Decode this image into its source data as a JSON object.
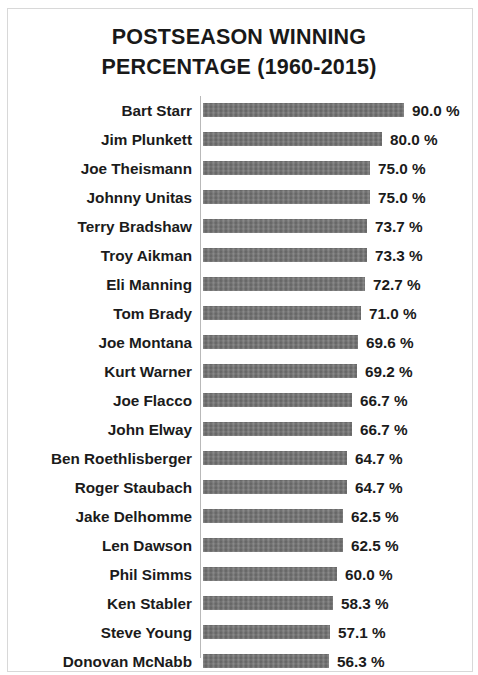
{
  "chart_data": {
    "type": "bar",
    "orientation": "horizontal",
    "title": "POSTSEASON WINNING PERCENTAGE (1960-2015)",
    "title_lines": [
      "POSTSEASON WINNING",
      "PERCENTAGE (1960-2015)"
    ],
    "xlabel": "",
    "ylabel": "",
    "xlim": [
      0,
      90
    ],
    "grid": false,
    "legend": null,
    "value_suffix": " %",
    "bar_color": "#707070",
    "axis_color": "#b9b9b9",
    "categories": [
      "Bart Starr",
      "Jim Plunkett",
      "Joe Theismann",
      "Johnny Unitas",
      "Terry Bradshaw",
      "Troy Aikman",
      "Eli Manning",
      "Tom Brady",
      "Joe Montana",
      "Kurt Warner",
      "Joe Flacco",
      "John Elway",
      "Ben Roethlisberger",
      "Roger Staubach",
      "Jake Delhomme",
      "Len Dawson",
      "Phil Simms",
      "Ken Stabler",
      "Steve Young",
      "Donovan McNabb"
    ],
    "values": [
      90.0,
      80.0,
      75.0,
      75.0,
      73.7,
      73.3,
      72.7,
      71.0,
      69.6,
      69.2,
      66.7,
      66.7,
      64.7,
      64.7,
      62.5,
      62.5,
      60.0,
      58.3,
      57.1,
      56.3
    ],
    "value_labels": [
      "90.0 %",
      "80.0 %",
      "75.0 %",
      "75.0 %",
      "73.7 %",
      "73.3 %",
      "72.7 %",
      "71.0 %",
      "69.6 %",
      "69.2 %",
      "66.7 %",
      "66.7 %",
      "64.7 %",
      "64.7 %",
      "62.5 %",
      "62.5 %",
      "60.0 %",
      "58.3 %",
      "57.1 %",
      "56.3 %"
    ]
  }
}
